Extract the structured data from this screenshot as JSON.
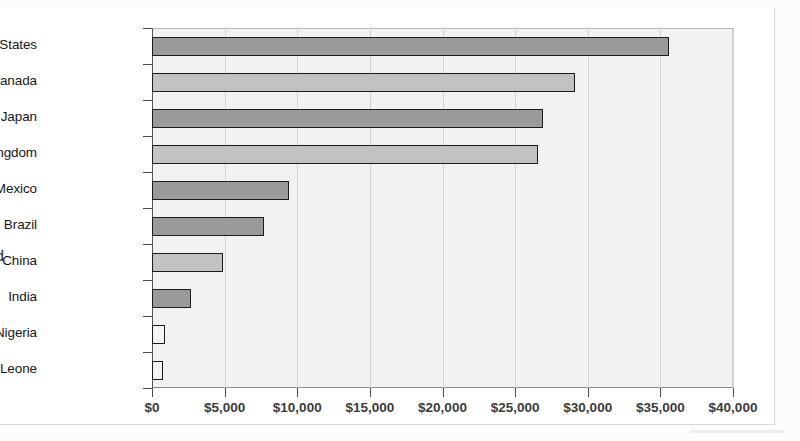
{
  "figure": {
    "axis_title_remnant": "d"
  },
  "chart_data": {
    "type": "bar",
    "orientation": "horizontal",
    "title": "",
    "subtitle": "",
    "xlabel": "",
    "ylabel": "",
    "categories": [
      "United States",
      "Canada",
      "Japan",
      "United Kingdom",
      "Mexico",
      "Brazil",
      "China",
      "India",
      "Nigeria",
      "Sierra Leone"
    ],
    "values": [
      35600,
      29100,
      26900,
      26600,
      9400,
      7700,
      4900,
      2700,
      900,
      750
    ],
    "value_prefix": "$",
    "xlim": [
      0,
      40000
    ],
    "xticks": [
      0,
      5000,
      10000,
      15000,
      20000,
      25000,
      30000,
      35000,
      40000
    ],
    "xtick_labels": [
      "$0",
      "$5,000",
      "$10,000",
      "$15,000",
      "$20,000",
      "$25,000",
      "$30,000",
      "$35,000",
      "$40,000"
    ],
    "grid": true,
    "grid_axis": "x",
    "legend": false,
    "legend_position": "none",
    "bar_shading": [
      "dark",
      "light",
      "dark",
      "light",
      "dark",
      "dark",
      "light",
      "dark",
      "empty",
      "empty"
    ],
    "colors": {
      "bar_dark": "#9a9a9a",
      "bar_light": "#c2c2c2",
      "bar_empty": "#f4f4f4",
      "bar_border": "#1b1b1b",
      "plot_background": "#f2f2f2",
      "gridline": "#d4d4d4",
      "axis": "#4a4a4a",
      "text": "#171717",
      "page_background": "#ffffff"
    }
  }
}
